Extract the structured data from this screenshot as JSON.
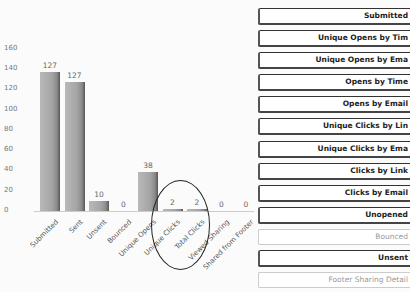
{
  "chart_data": {
    "type": "bar",
    "title": "",
    "xlabel": "",
    "ylabel": "",
    "ylim": [
      0,
      160
    ],
    "yticks": [
      0,
      20,
      40,
      60,
      80,
      100,
      120,
      140,
      160
    ],
    "grid": false,
    "categories": [
      "Submitted",
      "Sent",
      "Unsent",
      "Bounced",
      "Unique Opens",
      "Unique Clicks",
      "Total Clicks",
      "Viewed Sharing",
      "Shared from Footer"
    ],
    "values": [
      137,
      127,
      10,
      0,
      38,
      2,
      2,
      0,
      0
    ],
    "value_labels": [
      "127",
      "127",
      "10",
      "0",
      "38",
      "2",
      "2",
      "0",
      "0"
    ],
    "annotation": "hand-drawn ellipse around Unique Clicks and Total Clicks"
  },
  "yaxis": {
    "ticks": [
      "0",
      "20",
      "40",
      "60",
      "80",
      "100",
      "120",
      "140",
      "160"
    ]
  },
  "buttons": [
    {
      "label": "Submitted",
      "enabled": true
    },
    {
      "label": "Unique Opens by Tim",
      "enabled": true
    },
    {
      "label": "Unique Opens by Ema",
      "enabled": true
    },
    {
      "label": "Opens by Time",
      "enabled": true
    },
    {
      "label": "Opens by Email",
      "enabled": true
    },
    {
      "label": "Unique Clicks by Lin",
      "enabled": true
    },
    {
      "label": "Unique Clicks by Ema",
      "enabled": true
    },
    {
      "label": "Clicks by Link",
      "enabled": true
    },
    {
      "label": "Clicks by Email",
      "enabled": true
    },
    {
      "label": "Unopened",
      "enabled": true
    },
    {
      "label": "Bounced",
      "enabled": false
    },
    {
      "label": "Unsent",
      "enabled": true
    },
    {
      "label": "Footer Sharing Detail",
      "enabled": false
    }
  ]
}
